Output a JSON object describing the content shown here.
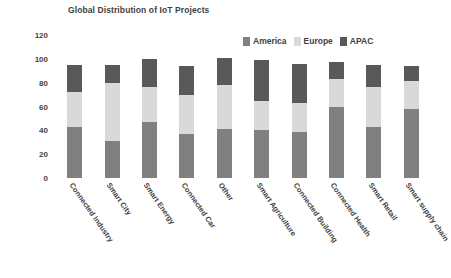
{
  "chart_data": {
    "type": "bar",
    "subtype": "stacked-vertical",
    "title": "Global Distribution of IoT Projects",
    "xlabel": "",
    "ylabel": "",
    "ylim": [
      0,
      120
    ],
    "yticks": [
      0,
      20,
      40,
      60,
      80,
      100,
      120
    ],
    "grid": false,
    "legend_position": "top-right",
    "categories": [
      "Connected Industry",
      "Smart City",
      "Smart Energy",
      "Connected Car",
      "Other",
      "Smart Agriculture",
      "Connected Building",
      "Connected Health",
      "Smart Retail",
      "Smart supply chain"
    ],
    "series": [
      {
        "name": "America",
        "color": "#808080",
        "values": [
          43,
          31,
          47,
          37,
          41,
          40,
          39,
          60,
          43,
          58
        ]
      },
      {
        "name": "Europe",
        "color": "#d9d9d9",
        "values": [
          29,
          49,
          29,
          33,
          37,
          25,
          24,
          23,
          33,
          23
        ]
      },
      {
        "name": "APAC",
        "color": "#595959",
        "values": [
          23,
          15,
          24,
          24,
          23,
          34,
          33,
          14,
          19,
          13
        ]
      }
    ],
    "totals": [
      95,
      95,
      100,
      94,
      101,
      99,
      96,
      97,
      95,
      94
    ]
  },
  "legend": {
    "entries": [
      {
        "label": "America",
        "color": "#808080",
        "icon": "legend-swatch-icon"
      },
      {
        "label": "Europe",
        "color": "#d9d9d9",
        "icon": "legend-swatch-icon"
      },
      {
        "label": "APAC",
        "color": "#595959",
        "icon": "legend-swatch-icon"
      }
    ]
  },
  "axis": {
    "y_tick_labels": [
      "120",
      "100",
      "80",
      "60",
      "40",
      "20",
      "0"
    ]
  }
}
